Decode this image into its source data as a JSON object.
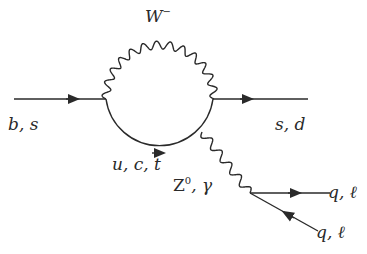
{
  "diagram": {
    "type": "feynman-penguin",
    "line_color": "#2a2a2a",
    "labels": {
      "incoming": "b, s",
      "outgoing": "s, d",
      "w_boson": "W",
      "w_boson_sup": "−",
      "loop_quarks": "u, c, t",
      "neutral_boson_main": "Z",
      "neutral_boson_sup": "0",
      "neutral_boson_rest": ", γ",
      "final_upper": "q, ℓ",
      "final_lower": "q, ℓ"
    },
    "lines": [
      {
        "name": "incoming-fermion",
        "kind": "fermion",
        "from": [
          14,
          99
        ],
        "to": [
          106,
          99
        ]
      },
      {
        "name": "outgoing-fermion",
        "kind": "fermion",
        "from": [
          213,
          99
        ],
        "to": [
          308,
          99
        ]
      },
      {
        "name": "w-boson-loop",
        "kind": "boson-wavy-arc",
        "center": [
          160,
          99
        ],
        "radius": 54
      },
      {
        "name": "loop-quark-arc",
        "kind": "fermion-arc",
        "center": [
          160,
          99
        ],
        "radius": 54
      },
      {
        "name": "z-gamma-propagator",
        "kind": "boson-wavy",
        "from": [
          202,
          132
        ],
        "to": [
          250,
          193
        ]
      },
      {
        "name": "final-upper-fermion",
        "kind": "fermion",
        "from": [
          250,
          193
        ],
        "to": [
          330,
          193
        ]
      },
      {
        "name": "final-lower-fermion",
        "kind": "antifermion",
        "from": [
          318,
          231
        ],
        "to": [
          250,
          193
        ]
      }
    ]
  }
}
